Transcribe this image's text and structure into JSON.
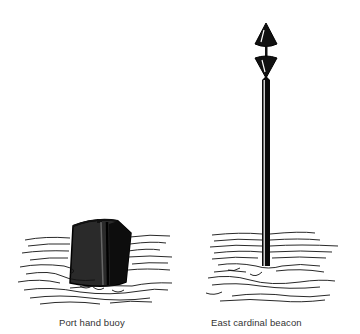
{
  "figures": [
    {
      "id": "port-hand-buoy",
      "caption": "Port hand buoy",
      "shape": "can",
      "color": "#222222"
    },
    {
      "id": "east-cardinal-beacon",
      "caption": "East cardinal beacon",
      "topmark": "two cones base to base",
      "color": "#111111"
    }
  ]
}
